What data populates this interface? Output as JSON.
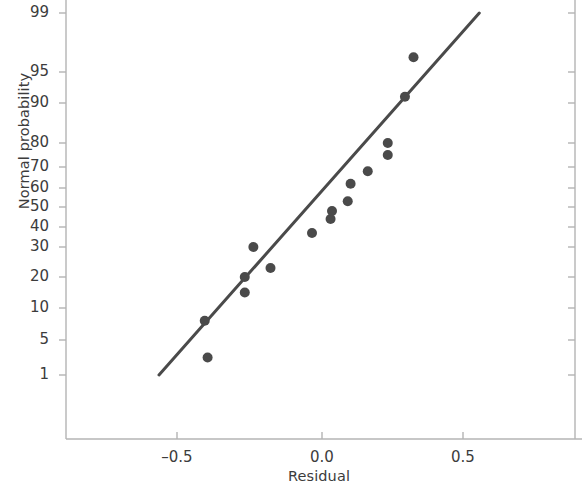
{
  "chart_data": {
    "type": "scatter",
    "title": "",
    "subtitle": "",
    "xlabel": "Residual",
    "ylabel": "Normal probability",
    "grid": false,
    "legend": null,
    "y_scale": "normal-probability",
    "xlim": [
      -0.78,
      0.99
    ],
    "xticks": [
      -0.5,
      0.0,
      0.5
    ],
    "xtick_labels": [
      "–0.5",
      "0.0",
      "0.5"
    ],
    "yticks": [
      1,
      5,
      10,
      20,
      30,
      40,
      50,
      60,
      70,
      80,
      90,
      95,
      99
    ],
    "ytick_labels": [
      "1",
      "5",
      "10",
      "20",
      "30",
      "40",
      "50",
      "60",
      "70",
      "80",
      "90",
      "95",
      "99"
    ],
    "x": [
      -0.4,
      -0.41,
      -0.27,
      -0.27,
      -0.24,
      -0.18,
      -0.035,
      0.03,
      0.035,
      0.09,
      0.1,
      0.16,
      0.23,
      0.23,
      0.29,
      0.32
    ],
    "y": [
      3,
      8,
      15,
      20,
      30,
      23,
      37,
      44,
      48,
      53,
      62,
      68,
      75,
      80,
      91,
      96
    ],
    "points": [
      {
        "residual": -0.4,
        "probability": 3
      },
      {
        "residual": -0.41,
        "probability": 8
      },
      {
        "residual": -0.27,
        "probability": 15
      },
      {
        "residual": -0.27,
        "probability": 20
      },
      {
        "residual": -0.24,
        "probability": 30
      },
      {
        "residual": -0.18,
        "probability": 23
      },
      {
        "residual": -0.035,
        "probability": 37
      },
      {
        "residual": 0.03,
        "probability": 44
      },
      {
        "residual": 0.035,
        "probability": 48
      },
      {
        "residual": 0.09,
        "probability": 53
      },
      {
        "residual": 0.1,
        "probability": 62
      },
      {
        "residual": 0.16,
        "probability": 68
      },
      {
        "residual": 0.23,
        "probability": 75
      },
      {
        "residual": 0.23,
        "probability": 80
      },
      {
        "residual": 0.29,
        "probability": 91
      },
      {
        "residual": 0.32,
        "probability": 96
      }
    ],
    "reference_line": {
      "label": "",
      "start": {
        "residual": -0.57,
        "probability": 1
      },
      "end": {
        "residual": 0.55,
        "probability": 99
      }
    },
    "colors": {
      "marker": "#4a4a4a",
      "line": "#4a4a4a",
      "axis": "#b4b4b4",
      "text": "#3c3c3c",
      "background": "#ffffff"
    },
    "marker_radius_px": 5,
    "line_width_px": 3
  },
  "geometry": {
    "plot_left_px": 66,
    "plot_right_px": 575,
    "plot_bottom_px": 439,
    "plot_top_px": 0,
    "x_origin_px": 322,
    "x_unit_px": 286,
    "ytick_px": [
      375,
      340,
      308,
      277,
      247,
      227,
      207,
      188,
      167,
      143,
      103,
      72,
      13
    ],
    "xtick_px": [
      177,
      322,
      463
    ]
  }
}
